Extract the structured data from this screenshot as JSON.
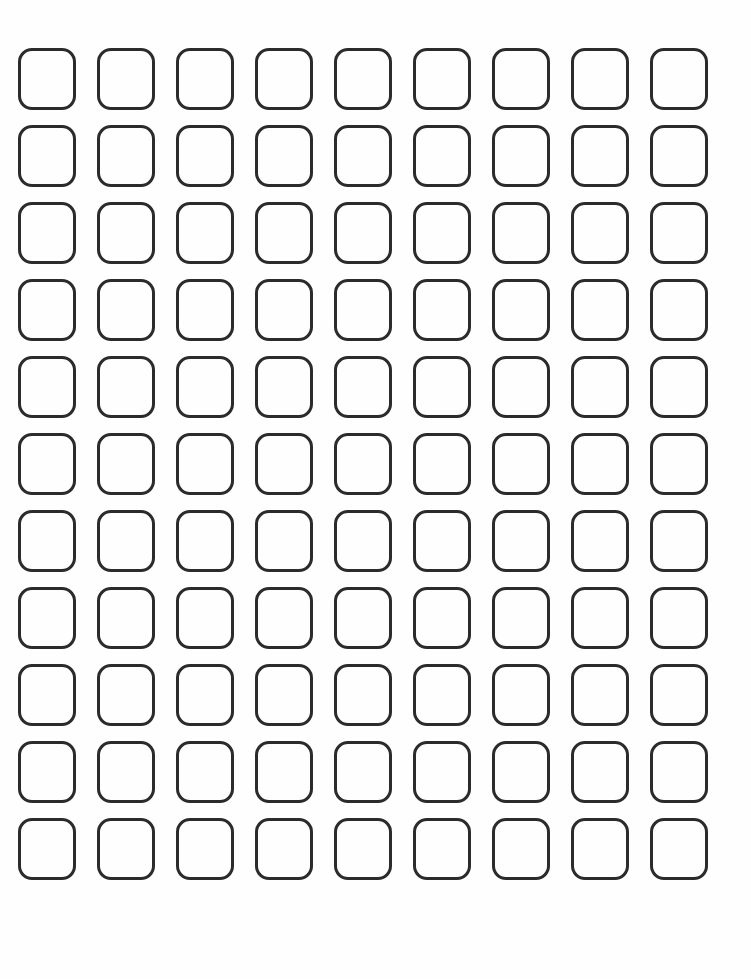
{
  "page": {
    "background_color": "#fefefe",
    "width": 751,
    "height": 979
  },
  "grid": {
    "name": "rounded-square-grid",
    "description": "Blank grid of empty rounded-square outline cells",
    "columns": 9,
    "rows": 11,
    "total_cells": 99,
    "origin_x": 18,
    "origin_y": 48,
    "cell_width": 58,
    "cell_height": 62,
    "column_pitch": 79,
    "row_pitch": 77,
    "corner_radius": 14,
    "stroke_width": 3,
    "stroke_color": "#2b2b2b",
    "fill_color": "transparent",
    "column_x": [
      18,
      97,
      176,
      255,
      334,
      413,
      492,
      571,
      650
    ],
    "row_y": [
      48,
      125,
      202,
      279,
      356,
      433,
      510,
      587,
      664,
      741,
      818
    ],
    "cell_labels": [
      [
        "",
        "",
        "",
        "",
        "",
        "",
        "",
        "",
        ""
      ],
      [
        "",
        "",
        "",
        "",
        "",
        "",
        "",
        "",
        ""
      ],
      [
        "",
        "",
        "",
        "",
        "",
        "",
        "",
        "",
        ""
      ],
      [
        "",
        "",
        "",
        "",
        "",
        "",
        "",
        "",
        ""
      ],
      [
        "",
        "",
        "",
        "",
        "",
        "",
        "",
        "",
        ""
      ],
      [
        "",
        "",
        "",
        "",
        "",
        "",
        "",
        "",
        ""
      ],
      [
        "",
        "",
        "",
        "",
        "",
        "",
        "",
        "",
        ""
      ],
      [
        "",
        "",
        "",
        "",
        "",
        "",
        "",
        "",
        ""
      ],
      [
        "",
        "",
        "",
        "",
        "",
        "",
        "",
        "",
        ""
      ],
      [
        "",
        "",
        "",
        "",
        "",
        "",
        "",
        "",
        ""
      ],
      [
        "",
        "",
        "",
        "",
        "",
        "",
        "",
        "",
        ""
      ]
    ]
  }
}
